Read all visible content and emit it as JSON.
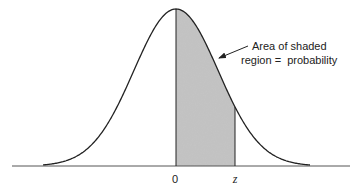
{
  "chart_data": {
    "type": "area",
    "title": "",
    "distribution": "normal",
    "mean": 0,
    "shaded_region": {
      "from": "0",
      "to": "z"
    },
    "x_tick_labels": [
      "0",
      "z"
    ],
    "annotation": {
      "line1": "Area of shaded",
      "line2": "region =  probability"
    },
    "xlabel": "",
    "ylabel": "",
    "grid": false,
    "legend": null
  },
  "labels": {
    "zero": "0",
    "z": "z",
    "annotation_line1": "Area of shaded",
    "annotation_line2": "region =  probability"
  },
  "colors": {
    "curve": "#222222",
    "shade": "#c4c4c4",
    "baseline": "#555555"
  }
}
